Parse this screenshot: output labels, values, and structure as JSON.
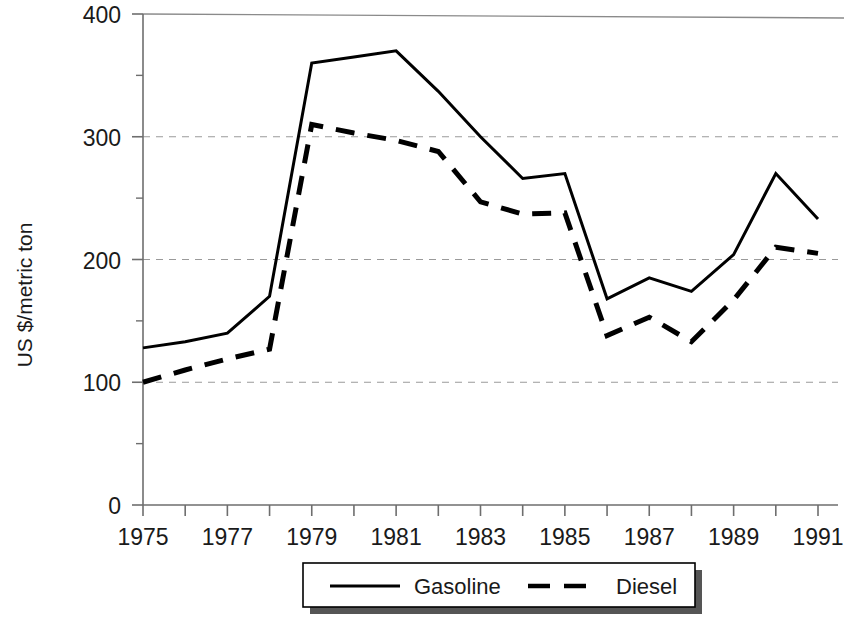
{
  "chart_data": {
    "type": "line",
    "title": "",
    "xlabel": "",
    "ylabel": "US $/metric ton",
    "x": [
      1975,
      1976,
      1977,
      1978,
      1979,
      1980,
      1981,
      1982,
      1983,
      1984,
      1985,
      1986,
      1987,
      1988,
      1989,
      1990,
      1991
    ],
    "xlim": [
      1975,
      1991
    ],
    "ylim": [
      0,
      400
    ],
    "y_ticks": [
      0,
      100,
      200,
      300,
      400
    ],
    "y_tick_labels": [
      "0",
      "100",
      "200",
      "300",
      "400"
    ],
    "y_minor_ticks": [
      50,
      150,
      250,
      350
    ],
    "x_ticks": [
      1975,
      1976,
      1977,
      1978,
      1979,
      1980,
      1981,
      1982,
      1983,
      1984,
      1985,
      1986,
      1987,
      1988,
      1989,
      1990,
      1991
    ],
    "x_tick_labels": [
      "1975",
      "",
      "1977",
      "",
      "1979",
      "",
      "1981",
      "",
      "1983",
      "",
      "1985",
      "",
      "1987",
      "",
      "1989",
      "",
      "1991"
    ],
    "x_labeled_ticks": [
      "1975",
      "1977",
      "1979",
      "1981",
      "1983",
      "1985",
      "1987",
      "1989",
      "1991"
    ],
    "grid": "horizontal-dashed-at-100-200-300",
    "legend_position": "bottom-center",
    "series": [
      {
        "name": "Gasoline",
        "style": "solid",
        "color": "#000000",
        "values": [
          128,
          133,
          140,
          170,
          360,
          365,
          370,
          337,
          300,
          266,
          270,
          168,
          185,
          174,
          204,
          270,
          233
        ]
      },
      {
        "name": "Diesel",
        "style": "dashed",
        "color": "#000000",
        "values": [
          100,
          110,
          119,
          127,
          310,
          303,
          297,
          288,
          247,
          237,
          238,
          138,
          153,
          133,
          167,
          210,
          205
        ]
      }
    ]
  },
  "axes": {
    "y_axis_title": "US $/metric ton"
  },
  "legend": {
    "items": [
      {
        "label": "Gasoline",
        "style": "solid"
      },
      {
        "label": "Diesel",
        "style": "dashed"
      }
    ]
  }
}
